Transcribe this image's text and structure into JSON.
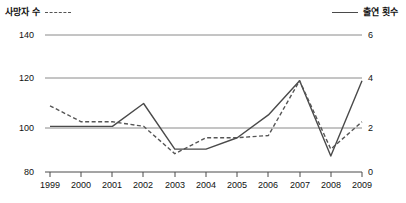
{
  "legend": {
    "series_left": {
      "label": "사망자 수",
      "style": "dashed",
      "color": "#555555"
    },
    "series_right": {
      "label": "출연 횟수",
      "style": "solid",
      "color": "#4a4a4a"
    }
  },
  "axes": {
    "left_ticks": [
      "140",
      "120",
      "100",
      "80"
    ],
    "right_ticks": [
      "6",
      "4",
      "2",
      "0"
    ],
    "x_ticks": [
      "1999",
      "2000",
      "2001",
      "2002",
      "2003",
      "2004",
      "2005",
      "2006",
      "2007",
      "2008",
      "2009"
    ]
  },
  "chart_data": {
    "type": "line",
    "title": "",
    "xlabel": "",
    "ylabel": "",
    "grid": true,
    "legend_position": "top",
    "categories": [
      "1999",
      "2000",
      "2001",
      "2002",
      "2003",
      "2004",
      "2005",
      "2006",
      "2007",
      "2008",
      "2009"
    ],
    "axes": {
      "left": {
        "label": "사망자 수",
        "min": 80,
        "max": 140,
        "ticks": [
          80,
          100,
          120,
          140
        ]
      },
      "right": {
        "label": "출연 횟수",
        "min": 0,
        "max": 6,
        "ticks": [
          0,
          2,
          4,
          6
        ]
      },
      "x": {
        "min": "1999",
        "max": "2009"
      }
    },
    "series": [
      {
        "name": "사망자 수",
        "axis": "left",
        "style": "dashed",
        "color": "#555555",
        "values": [
          109,
          102,
          102,
          100,
          88,
          95,
          95,
          96,
          120,
          90,
          102
        ]
      },
      {
        "name": "출연 횟수",
        "axis": "right",
        "style": "solid",
        "color": "#4a4a4a",
        "values": [
          2,
          2,
          2,
          3,
          1,
          1,
          1.5,
          2.5,
          4,
          0.7,
          4
        ]
      }
    ]
  }
}
